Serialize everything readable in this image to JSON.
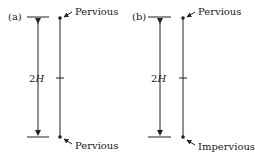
{
  "panels": [
    {
      "id": "a",
      "tag": "(a)",
      "thickness_label_num": "2",
      "thickness_label_var": "H",
      "top_boundary": "Pervious",
      "bottom_boundary": "Pervious"
    },
    {
      "id": "b",
      "tag": "(b)",
      "thickness_label_num": "2",
      "thickness_label_var": "H",
      "top_boundary": "Pervious",
      "bottom_boundary": "Impervious"
    }
  ],
  "colors": {
    "line": "#222222",
    "background": "#ffffff"
  }
}
